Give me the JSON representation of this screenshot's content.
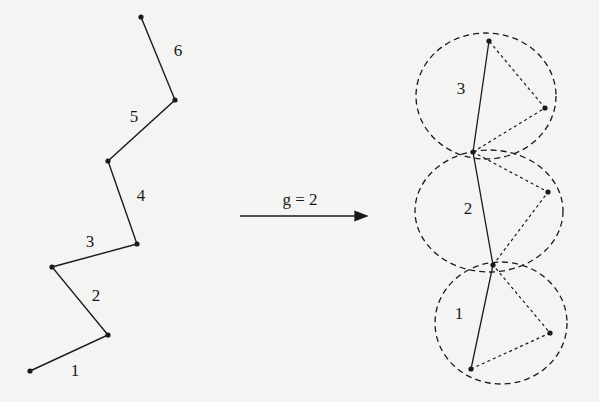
{
  "diagram": {
    "left_chain": {
      "points": [
        [
          30,
          371
        ],
        [
          108,
          335
        ],
        [
          52,
          267
        ],
        [
          137,
          244
        ],
        [
          108,
          161
        ],
        [
          175,
          100
        ],
        [
          141,
          17
        ]
      ],
      "segment_labels": [
        {
          "text": "1",
          "x": 75,
          "y": 376
        },
        {
          "text": "2",
          "x": 96,
          "y": 301
        },
        {
          "text": "3",
          "x": 90,
          "y": 247
        },
        {
          "text": "4",
          "x": 141,
          "y": 201
        },
        {
          "text": "5",
          "x": 134,
          "y": 122
        },
        {
          "text": "6",
          "x": 178,
          "y": 56
        }
      ]
    },
    "arrow": {
      "x1": 240,
      "y1": 216,
      "x2": 367,
      "y2": 216,
      "label": "g = 2",
      "label_x": 300,
      "label_y": 205
    },
    "right_chain": {
      "backbone": [
        [
          471,
          369
        ],
        [
          493,
          265
        ],
        [
          473,
          152
        ],
        [
          489,
          41
        ]
      ],
      "side_points": [
        [
          550,
          333
        ],
        [
          548,
          192
        ],
        [
          545,
          108
        ]
      ],
      "groups": [
        {
          "label": "1",
          "label_x": 459,
          "label_y": 319,
          "ellipse": {
            "cx": 501,
            "cy": 323,
            "rx": 66,
            "ry": 61
          }
        },
        {
          "label": "2",
          "label_x": 468,
          "label_y": 214,
          "ellipse": {
            "cx": 489,
            "cy": 211,
            "rx": 74,
            "ry": 61
          }
        },
        {
          "label": "3",
          "label_x": 461,
          "label_y": 94,
          "ellipse": {
            "cx": 486,
            "cy": 96,
            "rx": 70,
            "ry": 63
          }
        }
      ]
    },
    "colors": {
      "line": "#1a1a1a",
      "background": "#f4f4f2"
    }
  }
}
